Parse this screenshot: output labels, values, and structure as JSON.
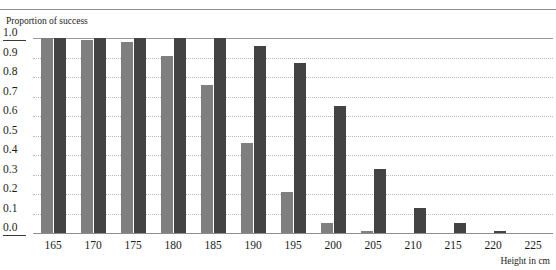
{
  "figure": {
    "caption_remnant": "",
    "y_axis_title": "Proportion of success",
    "x_axis_title": "Height in cm"
  },
  "chart_data": {
    "type": "bar",
    "title": "",
    "subtitle": "",
    "xlabel": "Height in cm",
    "ylabel": "Proportion of success",
    "categories": [
      "165",
      "170",
      "175",
      "180",
      "185",
      "190",
      "195",
      "200",
      "205",
      "210",
      "215",
      "220",
      "225"
    ],
    "series": [
      {
        "name": "light-gray-series",
        "color": "#7f7f7f",
        "values": [
          1.0,
          0.99,
          0.98,
          0.91,
          0.76,
          0.46,
          0.21,
          0.05,
          0.01,
          0.0,
          0.0,
          0.0,
          0.0
        ]
      },
      {
        "name": "dark-gray-series",
        "color": "#434343",
        "values": [
          1.0,
          1.0,
          1.0,
          1.0,
          1.0,
          0.96,
          0.87,
          0.65,
          0.33,
          0.13,
          0.05,
          0.01,
          0.0
        ]
      }
    ],
    "ylim": [
      0.0,
      1.0
    ],
    "ytick_labels": [
      "1.0",
      "0.9",
      "0.8",
      "0.7",
      "0.6",
      "0.5",
      "0.4",
      "0.3",
      "0.2",
      "0.1",
      "0.0"
    ],
    "ytick_values": [
      1.0,
      0.9,
      0.8,
      0.7,
      0.6,
      0.5,
      0.4,
      0.3,
      0.2,
      0.1,
      0.0
    ],
    "xtick_labels": [
      "165",
      "170",
      "175",
      "180",
      "185",
      "190",
      "195",
      "200",
      "205",
      "210",
      "215",
      "220",
      "225"
    ],
    "grid": "horizontal-dotted",
    "legend": "none"
  }
}
